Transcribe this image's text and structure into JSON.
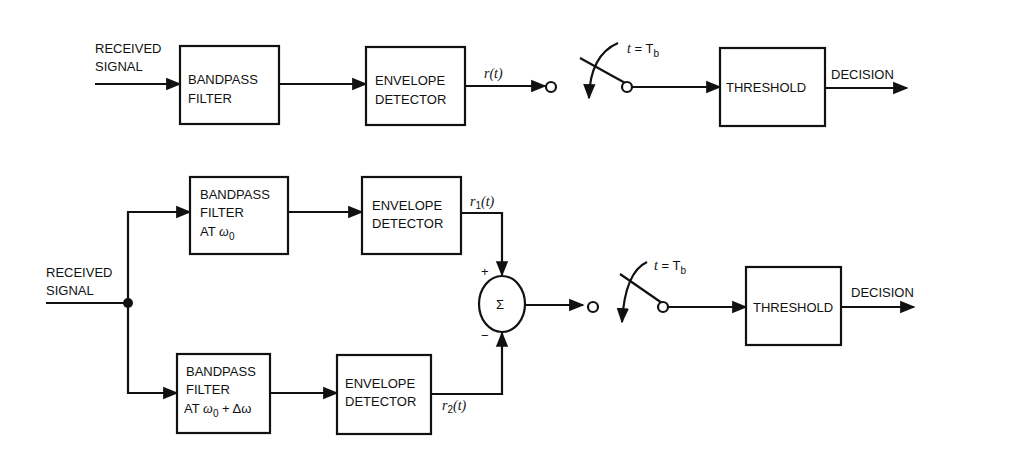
{
  "top_diagram": {
    "input_label_line1": "RECEIVED",
    "input_label_line2": "SIGNAL",
    "bandpass": {
      "line1": "BANDPASS",
      "line2": "FILTER"
    },
    "envelope": {
      "line1": "ENVELOPE",
      "line2": "DETECTOR"
    },
    "signal_label": "r(t)",
    "switch_label_t": "t",
    "switch_label_eq": " = T",
    "switch_label_sub": "b",
    "threshold": "THRESHOLD",
    "output_label": "DECISION"
  },
  "bottom_diagram": {
    "input_label_line1": "RECEIVED",
    "input_label_line2": "SIGNAL",
    "bandpass_upper": {
      "line1": "BANDPASS",
      "line2": "FILTER",
      "line3_prefix": "AT ",
      "line3_math": "ω",
      "line3_sub": "0"
    },
    "bandpass_lower": {
      "line1": "BANDPASS",
      "line2": "FILTER",
      "line3_prefix": "AT ",
      "line3_math": "ω",
      "line3_sub": "0",
      "line3_suffix": " + Δω"
    },
    "envelope_upper": {
      "line1": "ENVELOPE",
      "line2": "DETECTOR"
    },
    "envelope_lower": {
      "line1": "ENVELOPE",
      "line2": "DETECTOR"
    },
    "r1_label": {
      "r": "r",
      "sub": "1",
      "rest": "(t)"
    },
    "r2_label": {
      "r": "r",
      "sub": "2",
      "rest": "(t)"
    },
    "summer_symbol": "Σ",
    "plus_sign": "+",
    "minus_sign": "−",
    "switch_label_t": "t",
    "switch_label_eq": " = T",
    "switch_label_sub": "b",
    "threshold": "THRESHOLD",
    "output_label": "DECISION"
  }
}
